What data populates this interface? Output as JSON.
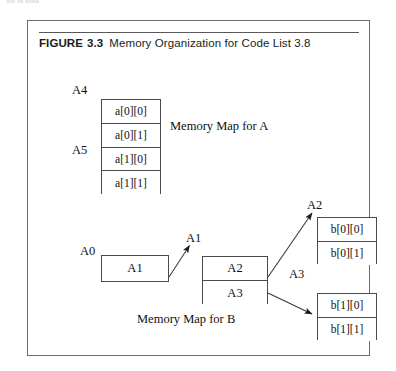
{
  "page": {
    "bleed_text": "are as used."
  },
  "figure": {
    "caption": {
      "keyword": "FIGURE",
      "number": "3.3",
      "title": "Memory Organization for Code List 3.8"
    },
    "array_a": {
      "labels": {
        "top": "A4",
        "third": "A5"
      },
      "cells": [
        "a[0][0]",
        "a[0][1]",
        "a[1][0]",
        "a[1][1]"
      ],
      "caption": "Memory Map for A"
    },
    "pointer_a": {
      "label": "A0",
      "value": "A1",
      "arrow_label": "A1"
    },
    "array_of_pointers": {
      "cells": [
        "A2",
        "A3"
      ],
      "arrow_labels": {
        "upper": "A2",
        "lower": "A3"
      }
    },
    "array_b_row0": {
      "cells": [
        "b[0][0]",
        "b[0][1]"
      ]
    },
    "array_b_row1": {
      "cells": [
        "b[1][0]",
        "b[1][1]"
      ]
    },
    "b_caption": "Memory Map for B",
    "colors": {
      "frame": "#6f6f72",
      "rule": "#58585b",
      "cell_border": "#4a4a4d",
      "text": "#101010",
      "background": "#ffffff"
    }
  }
}
